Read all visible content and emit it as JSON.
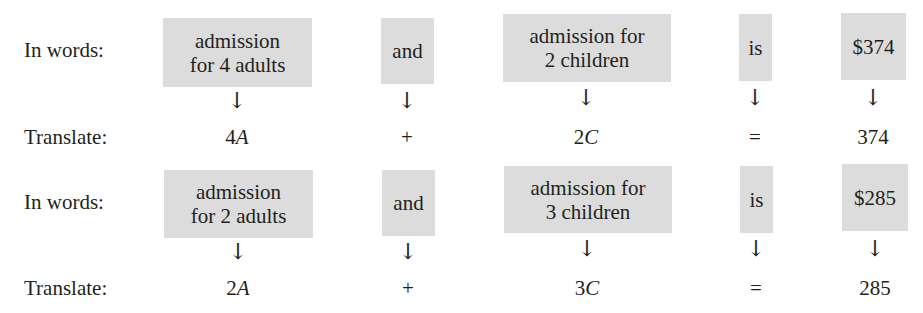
{
  "rows": [
    {
      "words_label": "In words:",
      "translate_label": "Translate:",
      "phrases": [
        {
          "line1": "admission",
          "line2": "for 4 adults",
          "translation_coef": "4",
          "translation_var": "A"
        },
        {
          "line1": "and",
          "line2": "",
          "translation_coef": "+",
          "translation_var": ""
        },
        {
          "line1": "admission for",
          "line2": "2 children",
          "translation_coef": "2",
          "translation_var": "C"
        },
        {
          "line1": "is",
          "line2": "",
          "translation_coef": "=",
          "translation_var": ""
        },
        {
          "line1": "$374",
          "line2": "",
          "translation_coef": "374",
          "translation_var": ""
        }
      ]
    },
    {
      "words_label": "In words:",
      "translate_label": "Translate:",
      "phrases": [
        {
          "line1": "admission",
          "line2": "for 2 adults",
          "translation_coef": "2",
          "translation_var": "A"
        },
        {
          "line1": "and",
          "line2": "",
          "translation_coef": "+",
          "translation_var": ""
        },
        {
          "line1": "admission for",
          "line2": "3 children",
          "translation_coef": "3",
          "translation_var": "C"
        },
        {
          "line1": "is",
          "line2": "",
          "translation_coef": "=",
          "translation_var": ""
        },
        {
          "line1": "$285",
          "line2": "",
          "translation_coef": "285",
          "translation_var": ""
        }
      ]
    }
  ],
  "arrow_glyph": "↓",
  "colors": {
    "box_fill": "#dcdcdc",
    "text": "#231f20"
  }
}
